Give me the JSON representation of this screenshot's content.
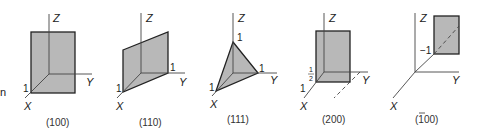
{
  "diagram": {
    "face_color": "#b8b8b8",
    "edge_color": "#222222",
    "axis_color": "#555555",
    "stray_left_glyph": "n",
    "panels": [
      {
        "caption": "(100)",
        "axes": {
          "x": "X",
          "y": "Y",
          "z": "Z"
        },
        "intercepts": [
          "1"
        ]
      },
      {
        "caption": "(110)",
        "axes": {
          "x": "X",
          "y": "Y",
          "z": "Z"
        },
        "intercepts": [
          "1",
          "1"
        ]
      },
      {
        "caption": "(111)",
        "axes": {
          "x": "X",
          "y": "Y",
          "z": "Z"
        },
        "intercepts": [
          "1",
          "1",
          "1"
        ]
      },
      {
        "caption": "(200)",
        "axes": {
          "x": "X",
          "y": "Y",
          "z": "Z"
        },
        "intercepts": [
          "1"
        ],
        "half": {
          "num": "1",
          "den": "2"
        }
      },
      {
        "caption": "(1̄ 00)",
        "caption_bar_digit": "1",
        "caption_rest": "00)",
        "caption_open": "(",
        "axes": {
          "x": "X",
          "y": "Y",
          "z": "Z"
        },
        "intercepts": [
          "−1"
        ]
      }
    ]
  }
}
